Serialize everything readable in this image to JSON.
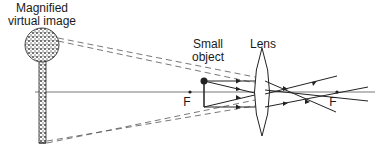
{
  "diagram": {
    "type": "ray diagram - magnifying glass",
    "labels": {
      "image_line1": "Magnified",
      "image_line2": "virtual image",
      "object_line1": "Small",
      "object_line2": "object",
      "lens": "Lens",
      "focal_left": "F",
      "focal_right": "F"
    },
    "colors": {
      "line": "#2a2a2a",
      "dashed": "#555555",
      "image_fill": "#6a6a6a"
    }
  }
}
